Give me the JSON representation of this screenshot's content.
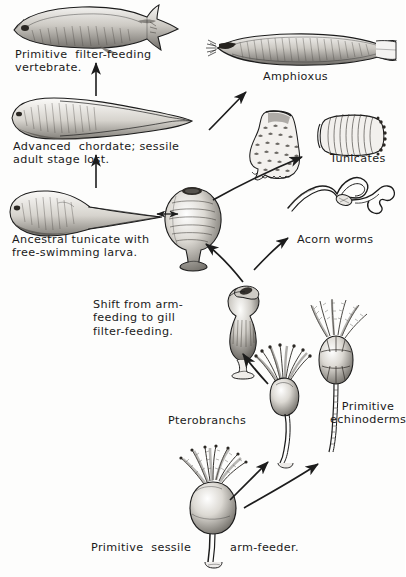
{
  "figure": {
    "background_color": "#fdfdfc",
    "ink_color": "#1c1c1c",
    "labels": [
      {
        "id": "primitive-vertebrate",
        "text": "Primitive  filter-feeding\nvertebrate.",
        "x": 15,
        "y": 48
      },
      {
        "id": "advanced-chordate",
        "text": "Advanced  chordate; sessile\nadult stage lost.",
        "x": 13,
        "y": 140
      },
      {
        "id": "ancestral-tunicate",
        "text": "Ancestral tunicate with\nfree-swimming larva.",
        "x": 12,
        "y": 233
      },
      {
        "id": "amphioxus",
        "text": "Amphioxus",
        "x": 263,
        "y": 70
      },
      {
        "id": "tunicates",
        "text": "Tunicates",
        "x": 330,
        "y": 152
      },
      {
        "id": "acorn-worms",
        "text": "Acorn worms",
        "x": 297,
        "y": 233
      },
      {
        "id": "shift-note",
        "text": "Shift from arm-\nfeeding to gill\nfilter-feeding.",
        "x": 93,
        "y": 298
      },
      {
        "id": "pterobranchs",
        "text": "Pterobranchs",
        "x": 168,
        "y": 414
      },
      {
        "id": "primitive-echinoderms",
        "text": "Primitive\nechinoderms",
        "x": 330,
        "y": 400
      },
      {
        "id": "primitive-sessile",
        "text": "Primitive  sessile",
        "x": 91,
        "y": 541
      },
      {
        "id": "arm-feeder",
        "text": "arm-feeder.",
        "x": 230,
        "y": 541
      }
    ],
    "organisms": [
      {
        "id": "primitive-vertebrate-fish",
        "name": "Primitive filter-feeding vertebrate",
        "cx": 97,
        "cy": 26
      },
      {
        "id": "advanced-chordate-larva",
        "name": "Advanced chordate larva",
        "cx": 97,
        "cy": 117
      },
      {
        "id": "ancestral-tunicate-larva",
        "name": "Ancestral tunicate tadpole larva",
        "cx": 92,
        "cy": 211
      },
      {
        "id": "amphioxus-animal",
        "name": "Amphioxus",
        "cx": 300,
        "cy": 53
      },
      {
        "id": "sessile-tunicate",
        "name": "Sessile adult tunicate",
        "cx": 193,
        "cy": 218
      },
      {
        "id": "solitary-tunicate",
        "name": "Solitary tunicate (ascidian)",
        "cx": 277,
        "cy": 140
      },
      {
        "id": "colonial-tunicate",
        "name": "Colonial tunicate",
        "cx": 351,
        "cy": 134
      },
      {
        "id": "acorn-worm-animal",
        "name": "Acorn worm",
        "cx": 333,
        "cy": 196
      },
      {
        "id": "gill-filter-feeder",
        "name": "Gill filter-feeding intermediate",
        "cx": 243,
        "cy": 310
      },
      {
        "id": "pterobranch-animal",
        "name": "Pterobranch",
        "cx": 283,
        "cy": 382
      },
      {
        "id": "primitive-echinoderm-animal",
        "name": "Primitive echinoderm (crinoid)",
        "cx": 337,
        "cy": 345
      },
      {
        "id": "primitive-arm-feeder",
        "name": "Primitive sessile arm-feeder",
        "cx": 213,
        "cy": 500
      }
    ],
    "arrows": [
      {
        "id": "arrow-larva-to-vertebrate",
        "from": "advanced-chordate-larva",
        "to": "primitive-vertebrate-fish",
        "style": "straight-up"
      },
      {
        "id": "arrow-tunicate-larva-to-chordate",
        "from": "ancestral-tunicate-larva",
        "to": "advanced-chordate-larva",
        "style": "straight-up"
      },
      {
        "id": "arrow-larva-tunicate-double",
        "from": "ancestral-tunicate-larva",
        "to": "sessile-tunicate",
        "style": "double-headed"
      },
      {
        "id": "arrow-tunicate-to-amphioxus",
        "from": "sessile-tunicate",
        "to": "amphioxus-animal",
        "style": "diagonal"
      },
      {
        "id": "arrow-tunicate-to-tunicates",
        "from": "sessile-tunicate",
        "to": "tunicates",
        "style": "diagonal"
      },
      {
        "id": "arrow-tunicate-to-acornworms",
        "from": "gill-filter-feeder",
        "to": "acorn-worm-animal",
        "style": "diagonal"
      },
      {
        "id": "arrow-gillfeeder-to-tunicate",
        "from": "gill-filter-feeder",
        "to": "sessile-tunicate",
        "style": "diagonal"
      },
      {
        "id": "arrow-pterobranch-to-gillfeeder",
        "from": "pterobranch-animal",
        "to": "gill-filter-feeder",
        "style": "diagonal"
      },
      {
        "id": "arrow-armfeeder-to-pterobranch",
        "from": "primitive-arm-feeder",
        "to": "pterobranch-animal",
        "style": "diagonal"
      },
      {
        "id": "arrow-armfeeder-to-echinoderm",
        "from": "primitive-arm-feeder",
        "to": "primitive-echinoderm-animal",
        "style": "diagonal"
      }
    ]
  }
}
